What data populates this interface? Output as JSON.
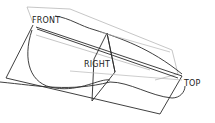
{
  "viewport": {
    "background": "#ffffff",
    "edge_color": "#2a2a2a",
    "hidden_edge_color": "#b5b5b5"
  },
  "datum_planes": [
    {
      "name": "FRONT",
      "label": "FRONT"
    },
    {
      "name": "RIGHT",
      "label": "RIGHT"
    },
    {
      "name": "TOP",
      "label": "TOP"
    }
  ]
}
